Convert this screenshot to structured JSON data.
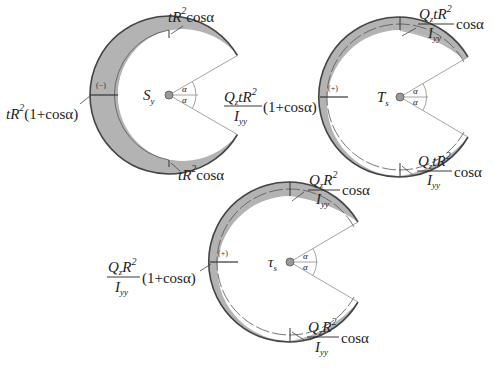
{
  "colors": {
    "fill": "#b3b3b3",
    "outline": "#444444",
    "thin_line": "#9a9a9a",
    "center_dot": "#999999",
    "text": "#222222"
  },
  "figures": [
    {
      "id": "Sy",
      "center_label": "S",
      "center_label_sub": "y",
      "sign": "(−)",
      "angle_symbol": "α",
      "labels": {
        "top": {
          "pre": "tR",
          "sup": "2",
          "post": "cosα"
        },
        "left": {
          "pre": "tR",
          "sup": "2",
          "post": "(1+cosα)"
        },
        "bottom": {
          "pre": "tR",
          "sup": "2",
          "post": "cosα"
        },
        "right": {
          "num_pre": "Q",
          "num_sub": "z",
          "num_mid": "tR",
          "num_sup": "2",
          "den": "I",
          "den_sub": "yy",
          "post": "(1+cosα)"
        }
      }
    },
    {
      "id": "Ts",
      "center_label": "T",
      "center_label_sub": "s",
      "sign": "(+)",
      "angle_symbol": "α",
      "labels": {
        "top": {
          "num_pre": "Q",
          "num_sub": "z",
          "num_mid": "tR",
          "num_sup": "2",
          "den": "I",
          "den_sub": "yy",
          "post": "cosα"
        },
        "bottom": {
          "num_pre": "Q",
          "num_sub": "z",
          "num_mid": "tR",
          "num_sup": "2",
          "den": "I",
          "den_sub": "yy",
          "post": "cosα"
        }
      }
    },
    {
      "id": "tau_s",
      "center_label": "τ",
      "center_label_sub": "s",
      "sign": "(+)",
      "angle_symbol": "α",
      "labels": {
        "top": {
          "num_pre": "Q",
          "num_sub": "z",
          "num_mid": "R",
          "num_sup": "2",
          "den": "I",
          "den_sub": "yy",
          "post": "cosα"
        },
        "left": {
          "num_pre": "Q",
          "num_sub": "z",
          "num_mid": "R",
          "num_sup": "2",
          "den": "I",
          "den_sub": "yy",
          "post": "(1+cosα)"
        },
        "bottom": {
          "num_pre": "Q",
          "num_sub": "z",
          "num_mid": "R",
          "num_sup": "2",
          "den": "I",
          "den_sub": "yy",
          "post": "cosα"
        }
      }
    }
  ]
}
